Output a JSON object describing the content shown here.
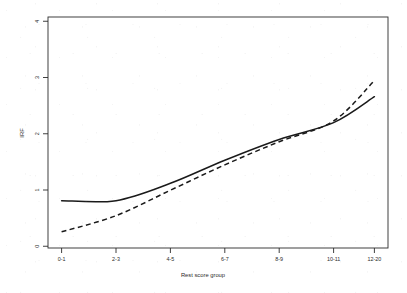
{
  "figure": {
    "background_color": "#ffffff",
    "ink_color": "#1a1a1a",
    "frame": {
      "left": 48,
      "top": 17,
      "right": 388,
      "bottom": 248
    }
  },
  "chart_data": {
    "type": "line",
    "title": "",
    "subtitle": "",
    "xlabel": "Rest score group",
    "ylabel": "IRF",
    "categories": [
      "0-1",
      "2-3",
      "4-5",
      "6-7",
      "8-9",
      "10-11",
      "12-20"
    ],
    "ylim": [
      0,
      4
    ],
    "yticks": [
      0,
      1,
      2,
      3,
      4
    ],
    "ytick_labels": [
      "0",
      "1",
      "2",
      "3",
      "4"
    ],
    "xtick_labels": [
      "0-1",
      "2-3",
      "4-5",
      "6-7",
      "8-9",
      "10-11",
      "12-20"
    ],
    "grid": false,
    "legend": "none",
    "series": [
      {
        "name": "solid-curve",
        "style": "solid",
        "color": "#1a1a1a",
        "values": [
          0.82,
          0.82,
          1.12,
          1.52,
          1.88,
          2.17,
          2.62
        ]
      },
      {
        "name": "dashed-curve",
        "style": "dashed",
        "color": "#1a1a1a",
        "values": [
          0.28,
          0.56,
          1.0,
          1.44,
          1.84,
          2.2,
          2.9
        ]
      }
    ],
    "annotations": [
      "The two curves cross just after the 10-11 group; the dashed curve rises more steeply to the right."
    ]
  }
}
